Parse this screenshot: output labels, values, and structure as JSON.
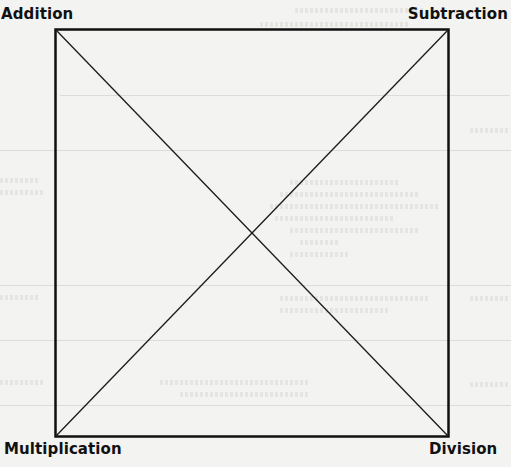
{
  "diagram": {
    "type": "square-with-diagonals",
    "corners": {
      "top_left": "Addition",
      "top_right": "Subtraction",
      "bottom_left": "Multiplication",
      "bottom_right": "Division"
    },
    "line_color": "#111111",
    "background_color": "#f3f3f1"
  }
}
